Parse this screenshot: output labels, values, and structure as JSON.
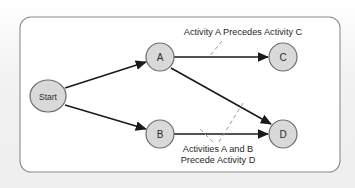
{
  "figure": {
    "type": "activity-network-diagram",
    "frame": {
      "x": 20,
      "y": 17,
      "width": 320,
      "height": 155,
      "corner_radius": 11,
      "border_color": "#8c8c8c",
      "fill_color": "#ffffff"
    },
    "background_color": "#f1f1f1",
    "node_fill": "#d9d9d9",
    "node_stroke": "#6e6e6e",
    "edge_color": "#1a1a1a",
    "leader_color": "#9a9a9a"
  },
  "nodes": [
    {
      "id": "start",
      "label": "Start",
      "shape": "ellipse",
      "cx": 48,
      "cy": 96,
      "rx": 18,
      "ry": 16,
      "label_size": "small"
    },
    {
      "id": "a",
      "label": "A",
      "shape": "circle",
      "cx": 160,
      "cy": 57,
      "rx": 14,
      "ry": 14,
      "label_size": "letter"
    },
    {
      "id": "b",
      "label": "B",
      "shape": "circle",
      "cx": 160,
      "cy": 134,
      "rx": 14,
      "ry": 14,
      "label_size": "letter"
    },
    {
      "id": "c",
      "label": "C",
      "shape": "circle",
      "cx": 283,
      "cy": 57,
      "rx": 14,
      "ry": 14,
      "label_size": "letter"
    },
    {
      "id": "d",
      "label": "D",
      "shape": "circle",
      "cx": 283,
      "cy": 134,
      "rx": 14,
      "ry": 14,
      "label_size": "letter"
    }
  ],
  "edges": [
    {
      "id": "start-a",
      "from": "start",
      "to": "a",
      "x1": 65,
      "y1": 88,
      "x2": 146,
      "y2": 62
    },
    {
      "id": "start-b",
      "from": "start",
      "to": "b",
      "x1": 65,
      "y1": 105,
      "x2": 146,
      "y2": 129
    },
    {
      "id": "a-c",
      "from": "a",
      "to": "c",
      "x1": 174,
      "y1": 57,
      "x2": 268,
      "y2": 57
    },
    {
      "id": "a-d",
      "from": "a",
      "to": "d",
      "x1": 171,
      "y1": 68,
      "x2": 271,
      "y2": 124
    },
    {
      "id": "b-d",
      "from": "b",
      "to": "d",
      "x1": 174,
      "y1": 134,
      "x2": 268,
      "y2": 134
    }
  ],
  "annotations": [
    {
      "id": "annotation-a-precedes-c",
      "lines": [
        "Activity A Precedes Activity C"
      ],
      "anchor_x": 243,
      "first_line_y": 32,
      "line_height": 11,
      "leaders": [
        {
          "x1": 222,
          "y1": 41,
          "x2": 209,
          "y2": 57
        }
      ]
    },
    {
      "id": "annotation-a-and-b-precede-d",
      "lines": [
        "Activities A and B",
        "Precede Activity D"
      ],
      "anchor_x": 218,
      "first_line_y": 149,
      "line_height": 11,
      "leaders": [
        {
          "x1": 213,
          "y1": 142,
          "x2": 198,
          "y2": 127
        },
        {
          "x1": 219,
          "y1": 142,
          "x2": 243,
          "y2": 103
        }
      ]
    }
  ]
}
